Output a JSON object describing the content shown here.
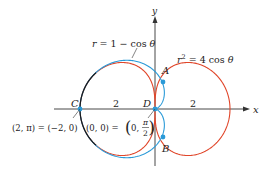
{
  "diagram": {
    "axes": {
      "x_label": "x",
      "y_label": "y"
    },
    "curves": [
      {
        "name": "cardioid",
        "equation": "r = 1 − cos θ",
        "color": "#2a9ad8"
      },
      {
        "name": "lemniscate",
        "equation": "r² = 4 cos θ",
        "color": "#e0462a"
      }
    ],
    "overlap_color": "#1a1a1a",
    "points": [
      {
        "label": "A"
      },
      {
        "label": "B"
      },
      {
        "label": "C"
      },
      {
        "label": "D"
      }
    ],
    "tick_labels": {
      "left": "2",
      "right": "2"
    },
    "annotations": {
      "c_coords": "(2, π) = (−2, 0)",
      "d_coords_left": "(0, 0) = ",
      "d_coords_right": "0, ",
      "pi": "π",
      "two": "2"
    },
    "eq_labels": {
      "cardioid_lhs": "r",
      "cardioid_rhs": " = 1 − cos ",
      "theta": "θ",
      "lem_r": "r",
      "lem_sup": "2",
      "lem_rhs": " = 4 cos "
    }
  }
}
